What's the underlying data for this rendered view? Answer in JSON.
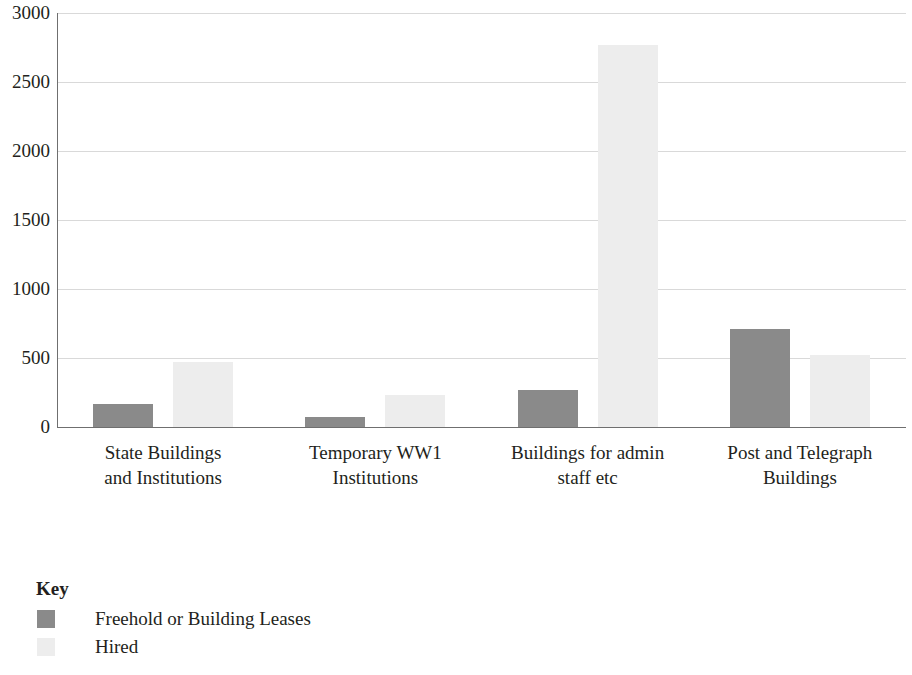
{
  "chart_data": {
    "type": "bar",
    "title": "",
    "subtitle": "",
    "xlabel": "",
    "ylabel": "",
    "ylim": [
      0,
      3000
    ],
    "yticks": [
      0,
      500,
      1000,
      1500,
      2000,
      2500,
      3000
    ],
    "ytick_labels": [
      "0",
      "500",
      "1000",
      "1500",
      "2000",
      "2500",
      "3000"
    ],
    "grid": true,
    "grid_axis": "y",
    "legend_position": "below-left",
    "legend_title": "Key",
    "categories": [
      "State Buildings and Institutions",
      "Temporary WW1 Institutions",
      "Buildings for admin staff etc",
      "Post and Telegraph Buildings"
    ],
    "category_lines": [
      [
        "State Buildings",
        "and Institutions"
      ],
      [
        "Temporary WW1",
        "Institutions"
      ],
      [
        "Buildings for admin",
        "staff etc"
      ],
      [
        "Post and Telegraph",
        "Buildings"
      ]
    ],
    "series": [
      {
        "name": "Freehold or Building Leases",
        "color": "#8a8a8a",
        "values": [
          170,
          75,
          270,
          710
        ]
      },
      {
        "name": "Hired",
        "color": "#ededed",
        "values": [
          470,
          230,
          2770,
          520
        ]
      }
    ]
  },
  "legend": {
    "title": "Key",
    "items": [
      {
        "label": "Freehold or Building Leases",
        "swatch": "freehold"
      },
      {
        "label": "Hired",
        "swatch": "hired"
      }
    ]
  },
  "colors": {
    "freehold": "#8a8a8a",
    "hired": "#ededed",
    "axis": "#6f6f6f",
    "grid": "#d9d9d9",
    "text": "#231f20",
    "background": "#ffffff"
  }
}
